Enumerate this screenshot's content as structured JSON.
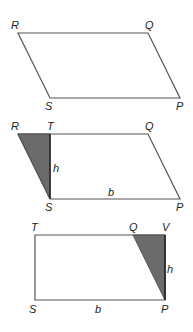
{
  "diagram": {
    "colors": {
      "edge": "#555555",
      "shade": "#6b6b6b",
      "label": "#222222",
      "background": "#ffffff"
    },
    "figures": [
      {
        "id": "parallelogram",
        "labels": {
          "R": "R",
          "Q": "Q",
          "S": "S",
          "P": "P"
        }
      },
      {
        "id": "parallelogram-with-height",
        "labels": {
          "R": "R",
          "T": "T",
          "Q": "Q",
          "S": "S",
          "P": "P",
          "h": "h",
          "b": "b"
        },
        "shaded_triangle": "RTS"
      },
      {
        "id": "rectangle",
        "labels": {
          "T": "T",
          "Q": "Q",
          "V": "V",
          "S": "S",
          "P": "P",
          "h": "h",
          "b": "b"
        },
        "shaded_triangle": "QVP"
      }
    ]
  }
}
